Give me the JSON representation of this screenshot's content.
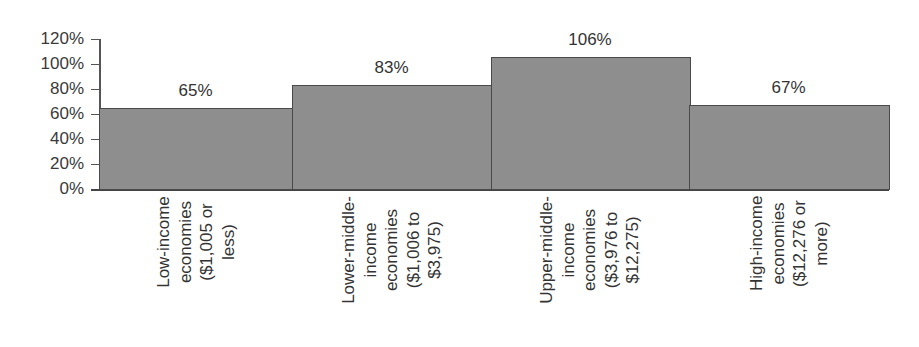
{
  "chart_data": {
    "type": "bar",
    "title": "",
    "xlabel": "",
    "ylabel": "",
    "ylim": [
      0,
      120
    ],
    "yticks": [
      "0%",
      "20%",
      "40%",
      "60%",
      "80%",
      "100%",
      "120%"
    ],
    "ytick_values": [
      0,
      20,
      40,
      60,
      80,
      100,
      120
    ],
    "grid": false,
    "legend": null,
    "bar_gap": 0,
    "categories": [
      "Low-income economies ($1,005 or less)",
      "Lower-middle-income economies ($1,006 to $3,975)",
      "Upper-middle-income economies ($3,976 to $12,275)",
      "High-income economies ($12,276 or more)"
    ],
    "category_label_lines": [
      [
        "Low-income",
        "economies",
        "($1,005 or",
        "less)"
      ],
      [
        "Lower-middle-",
        "income",
        "economies",
        "($1,006 to",
        "$3,975)"
      ],
      [
        "Upper-middle-",
        "income",
        "economies",
        "($3,976 to",
        "$12,275)"
      ],
      [
        "High-income",
        "economies",
        "($12,276 or",
        "more)"
      ]
    ],
    "values": [
      65,
      83,
      106,
      67
    ],
    "value_labels": [
      "65%",
      "83%",
      "106%",
      "67%"
    ],
    "colors": {
      "bar_fill": "#8e8e8e",
      "bar_edge": "#4a4a4a",
      "text": "#333333"
    }
  }
}
